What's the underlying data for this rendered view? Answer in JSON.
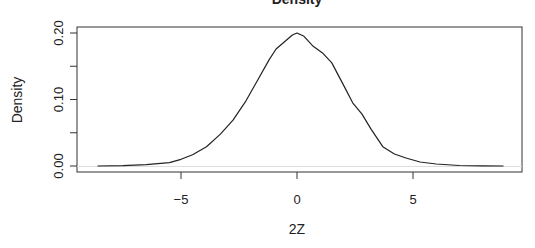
{
  "chart_data": {
    "type": "line",
    "title": "Density",
    "xlabel": "2Z",
    "ylabel": "Density",
    "xlim": [
      -9.2,
      9.6
    ],
    "ylim": [
      -0.01,
      0.209
    ],
    "x_ticks": [
      -5,
      0,
      5
    ],
    "x_tick_labels": [
      "-5",
      "0",
      "5"
    ],
    "y_ticks": [
      0.0,
      0.05,
      0.1,
      0.15,
      0.2
    ],
    "y_tick_labels": [
      "0.00",
      "",
      "0.10",
      "",
      "0.20"
    ],
    "grid": false,
    "legend": null,
    "series": [
      {
        "name": "density",
        "color": "#222222",
        "x": [
          -8.6,
          -7.5,
          -6.5,
          -5.5,
          -5.0,
          -4.5,
          -3.9,
          -3.3,
          -2.76,
          -2.2,
          -1.7,
          -1.2,
          -0.9,
          -0.5,
          -0.2,
          0.0,
          0.3,
          0.7,
          1.1,
          1.5,
          2.0,
          2.4,
          2.8,
          3.2,
          3.7,
          4.2,
          4.7,
          5.3,
          6.0,
          7.0,
          8.0,
          8.9
        ],
        "values": [
          0.0,
          0.0005,
          0.002,
          0.005,
          0.01,
          0.017,
          0.029,
          0.048,
          0.069,
          0.098,
          0.129,
          0.16,
          0.176,
          0.188,
          0.197,
          0.2,
          0.195,
          0.18,
          0.17,
          0.155,
          0.122,
          0.095,
          0.078,
          0.055,
          0.029,
          0.018,
          0.012,
          0.006,
          0.003,
          0.0008,
          0.0002,
          0.0
        ]
      }
    ]
  }
}
